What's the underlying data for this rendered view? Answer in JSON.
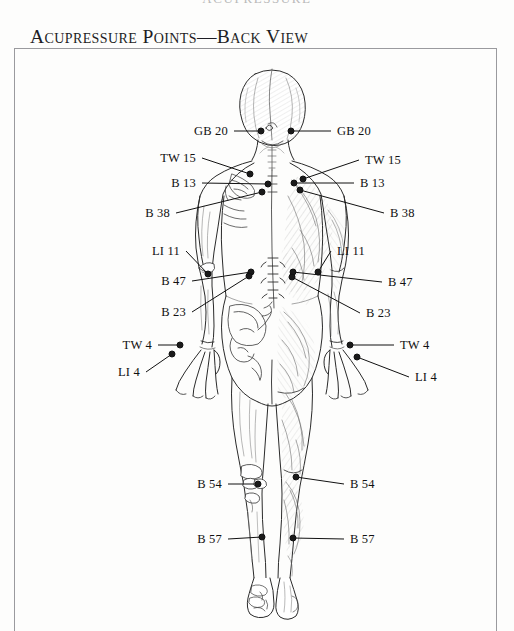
{
  "document": {
    "running_header": "ACUPRESSURE",
    "title": "Acupressure Points—Back View"
  },
  "figure": {
    "colors": {
      "ink": "#1a1a1a",
      "paper": "#fdfdfc",
      "frame": "#9a9a9e",
      "leader": "#111111",
      "shading": "#9b9b9b"
    },
    "labels_left": [
      {
        "id": "gb20-left",
        "text": "GB 20",
        "lx": 228,
        "ly": 131,
        "px": 261,
        "py": 131
      },
      {
        "id": "tw15-left",
        "text": "TW 15",
        "lx": 196,
        "ly": 158,
        "px": 250,
        "py": 174
      },
      {
        "id": "b13-left",
        "text": "B 13",
        "lx": 196,
        "ly": 183,
        "px": 268,
        "py": 184
      },
      {
        "id": "b38-left",
        "text": "B 38",
        "lx": 170,
        "ly": 213,
        "px": 262,
        "py": 192
      },
      {
        "id": "li11-left",
        "text": "LI 11",
        "lx": 180,
        "ly": 251,
        "px": 208,
        "py": 274
      },
      {
        "id": "b47-left",
        "text": "B 47",
        "lx": 186,
        "ly": 281,
        "px": 251,
        "py": 272
      },
      {
        "id": "b23-left",
        "text": "B 23",
        "lx": 186,
        "ly": 312,
        "px": 249,
        "py": 276
      },
      {
        "id": "tw4-left",
        "text": "TW 4",
        "lx": 152,
        "ly": 345,
        "px": 180,
        "py": 345
      },
      {
        "id": "li4-left",
        "text": "LI 4",
        "lx": 140,
        "ly": 372,
        "px": 172,
        "py": 354
      },
      {
        "id": "b54-left",
        "text": "B 54",
        "lx": 222,
        "ly": 484,
        "px": 258,
        "py": 484
      },
      {
        "id": "b57-left",
        "text": "B 57",
        "lx": 222,
        "ly": 539,
        "px": 262,
        "py": 537
      }
    ],
    "labels_right": [
      {
        "id": "gb20-right",
        "text": "GB 20",
        "lx": 337,
        "ly": 131,
        "px": 291,
        "py": 131
      },
      {
        "id": "tw15-right",
        "text": "TW 15",
        "lx": 365,
        "ly": 160,
        "px": 303,
        "py": 179
      },
      {
        "id": "b13-right",
        "text": "B 13",
        "lx": 360,
        "ly": 183,
        "px": 294,
        "py": 183
      },
      {
        "id": "b38-right",
        "text": "B 38",
        "lx": 390,
        "ly": 213,
        "px": 300,
        "py": 190
      },
      {
        "id": "li11-right",
        "text": "LI 11",
        "lx": 337,
        "ly": 251,
        "px": 318,
        "py": 272
      },
      {
        "id": "b47-right",
        "text": "B 47",
        "lx": 388,
        "ly": 282,
        "px": 293,
        "py": 272
      },
      {
        "id": "b23-right",
        "text": "B 23",
        "lx": 366,
        "ly": 313,
        "px": 292,
        "py": 277
      },
      {
        "id": "tw4-right",
        "text": "TW 4",
        "lx": 400,
        "ly": 345,
        "px": 350,
        "py": 345
      },
      {
        "id": "li4-right",
        "text": "LI 4",
        "lx": 415,
        "ly": 377,
        "px": 357,
        "py": 357
      },
      {
        "id": "b54-right",
        "text": "B 54",
        "lx": 350,
        "ly": 484,
        "px": 296,
        "py": 477
      },
      {
        "id": "b57-right",
        "text": "B 57",
        "lx": 350,
        "ly": 539,
        "px": 293,
        "py": 538
      }
    ]
  }
}
